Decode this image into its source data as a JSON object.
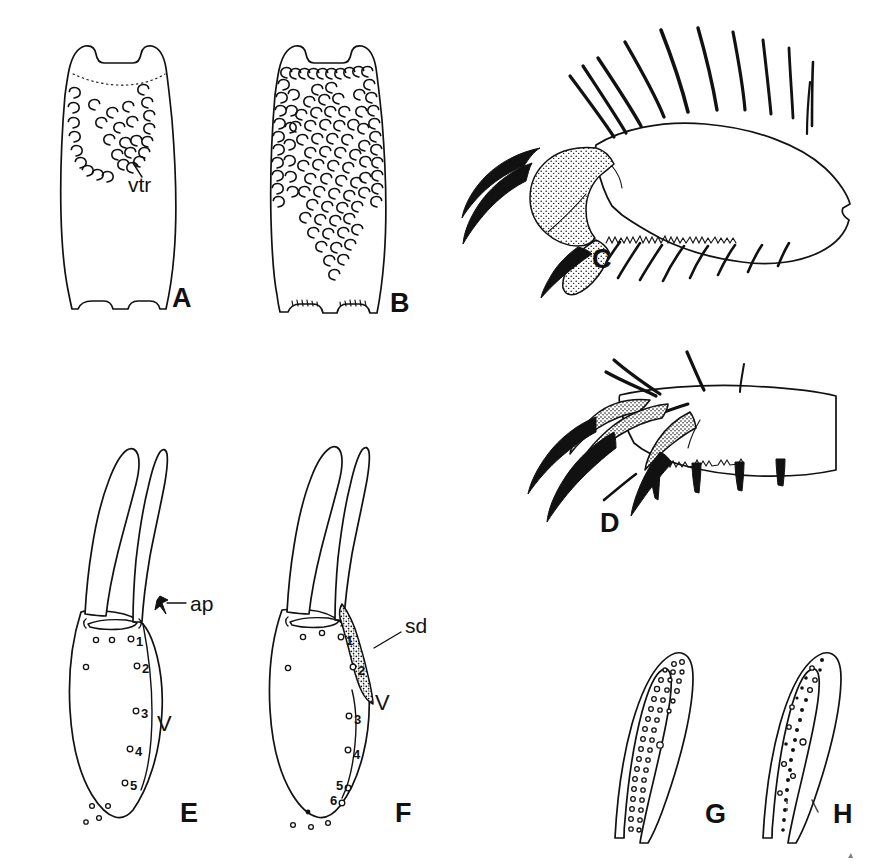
{
  "figure": {
    "type": "scientific-illustration-plate",
    "background_color": "#ffffff",
    "ink_color": "#111111",
    "width": 877,
    "height": 866,
    "panels": [
      {
        "letter": "A",
        "letter_x": 172,
        "letter_y": 307,
        "subject": "abdominal-segment-ventral-view-sparse-setae",
        "annotations": [
          "vtr"
        ]
      },
      {
        "letter": "B",
        "letter_x": 390,
        "letter_y": 312,
        "subject": "abdominal-segment-ventral-view-dense-setae",
        "annotations": []
      },
      {
        "letter": "C",
        "letter_x": 592,
        "letter_y": 268,
        "subject": "tarsus-and-pretarsus-with-claws-long-setae",
        "annotations": []
      },
      {
        "letter": "D",
        "letter_x": 600,
        "letter_y": 532,
        "subject": "tarsus-and-pretarsus-with-claws-short-setae",
        "annotations": []
      },
      {
        "letter": "E",
        "letter_x": 180,
        "letter_y": 822,
        "subject": "maxilla-with-apodeme",
        "annotations": [
          "ap",
          "V"
        ],
        "pore_numbers": [
          "1",
          "2",
          "3",
          "4",
          "5"
        ]
      },
      {
        "letter": "F",
        "letter_x": 395,
        "letter_y": 822,
        "subject": "maxilla-with-sclerotized-duct",
        "annotations": [
          "sd",
          "V"
        ],
        "pore_numbers": [
          "1",
          "2",
          "3",
          "4",
          "5",
          "6"
        ]
      },
      {
        "letter": "G",
        "letter_x": 705,
        "letter_y": 823,
        "subject": "apical-process-with-dense-pore-rows",
        "annotations": []
      },
      {
        "letter": "H",
        "letter_x": 833,
        "letter_y": 823,
        "subject": "apical-process-with-sparse-pore-rows",
        "annotations": []
      }
    ],
    "labels": {
      "vtr": "vtr",
      "ap": "ap",
      "sd": "sd",
      "v_panel_e": "V",
      "v_panel_f": "V"
    },
    "pore_numbers_e": [
      "1",
      "2",
      "3",
      "4",
      "5"
    ],
    "pore_numbers_f": [
      "1",
      "2",
      "3",
      "4",
      "5",
      "6"
    ]
  }
}
